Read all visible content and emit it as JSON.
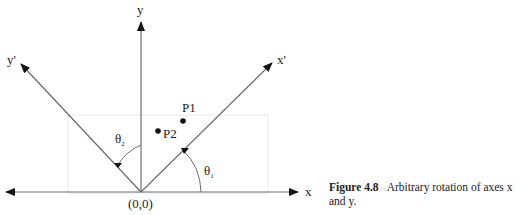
{
  "diagram": {
    "axes": {
      "x": "x",
      "y": "y",
      "x_prime": "x'",
      "y_prime": "y'"
    },
    "origin_label": "(0,0)",
    "points": [
      {
        "label": "P1"
      },
      {
        "label": "P2"
      }
    ],
    "angles": {
      "theta1": "θ",
      "theta1_sub": "1",
      "theta2": "θ",
      "theta2_sub": "2"
    },
    "colors": {
      "line": "#6e6e6e",
      "arrow": "#111111",
      "guide": "#e6e6e6"
    }
  },
  "caption": {
    "figure_label": "Figure 4.8",
    "text_line1": "Arbitrary rotation of axes x",
    "text_line2": "and y."
  }
}
